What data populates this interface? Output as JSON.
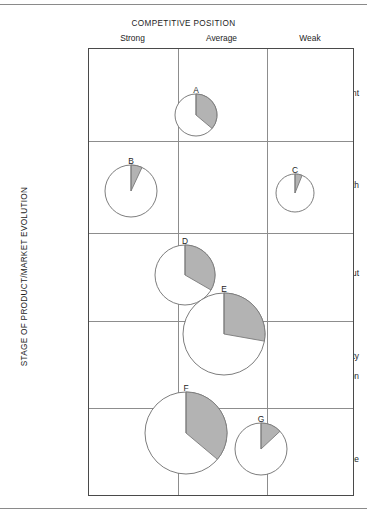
{
  "chart_data": {
    "type": "scatter",
    "title": "COMPETITIVE POSITION",
    "xlabel": "COMPETITIVE POSITION",
    "ylabel": "STAGE OF PRODUCT/MARKET EVOLUTION",
    "grid": true,
    "legend": "none",
    "x_categories": [
      "Strong",
      "Average",
      "Weak"
    ],
    "y_categories": [
      "Development",
      "Growth",
      "Shake-out",
      "Maturity / Saturation",
      "Decline"
    ],
    "marker_type": "pie-circle (circle area = business size, shaded wedge = market share)",
    "points": [
      {
        "name": "A",
        "x_category": "Average",
        "y_category": "Development",
        "cx": 107,
        "cy": 66,
        "radius": 21,
        "share_percent": 36,
        "wedge_degrees": 130,
        "label_dx": 0,
        "label_dy": -30
      },
      {
        "name": "B",
        "x_category": "Strong",
        "y_category": "Growth",
        "cx": 42,
        "cy": 142,
        "radius": 26,
        "share_percent": 7,
        "wedge_degrees": 25,
        "label_dx": 0,
        "label_dy": -35
      },
      {
        "name": "C",
        "x_category": "Weak",
        "y_category": "Growth",
        "cx": 206,
        "cy": 144,
        "radius": 19,
        "share_percent": 6,
        "wedge_degrees": 22,
        "label_dx": 0,
        "label_dy": -28
      },
      {
        "name": "D",
        "x_category": "Average",
        "y_category": "Shake-out",
        "cx": 96,
        "cy": 226,
        "radius": 30,
        "share_percent": 33,
        "wedge_degrees": 120,
        "label_dx": 0,
        "label_dy": -39
      },
      {
        "name": "E",
        "x_category": "Average",
        "y_category": "Shake-out / Maturity",
        "cx": 135,
        "cy": 285,
        "radius": 41,
        "share_percent": 28,
        "wedge_degrees": 100,
        "label_dx": 0,
        "label_dy": -50
      },
      {
        "name": "F",
        "x_category": "Average",
        "y_category": "Saturation",
        "cx": 97,
        "cy": 384,
        "radius": 41,
        "share_percent": 36,
        "wedge_degrees": 130,
        "label_dx": 0,
        "label_dy": -50
      },
      {
        "name": "G",
        "x_category": "Weak",
        "y_category": "Decline",
        "cx": 172,
        "cy": 400,
        "radius": 26,
        "share_percent": 13,
        "wedge_degrees": 47,
        "label_dx": 0,
        "label_dy": -35
      }
    ],
    "colors": {
      "wedge_fill": "#b3b3b3",
      "wedge_stroke": "#7a7a7a",
      "circle_stroke": "#6e6e6e",
      "grid_line": "#8d8d8d",
      "frame": "#4a4a4a",
      "text": "#1d1d1d"
    },
    "column_boundaries_px": [
      0,
      89,
      178,
      266
    ],
    "row_boundaries_px": [
      0,
      92,
      184,
      272,
      359,
      448
    ]
  },
  "header": {
    "title": "COMPETITIVE POSITION",
    "columns": [
      {
        "label": "Strong"
      },
      {
        "label": "Average"
      },
      {
        "label": "Weak"
      }
    ]
  },
  "axis": {
    "y_title": "STAGE OF PRODUCT/MARKET EVOLUTION"
  },
  "rows": [
    {
      "label": "Development"
    },
    {
      "label": "Growth"
    },
    {
      "label": "Shake-out"
    },
    {
      "label_top": "Maturity",
      "arrow": "↓",
      "label_bottom": "Saturation"
    },
    {
      "label": "Decline"
    }
  ],
  "pies": [
    {
      "letter": "A"
    },
    {
      "letter": "B"
    },
    {
      "letter": "C"
    },
    {
      "letter": "D"
    },
    {
      "letter": "E"
    },
    {
      "letter": "F"
    },
    {
      "letter": "G"
    }
  ]
}
